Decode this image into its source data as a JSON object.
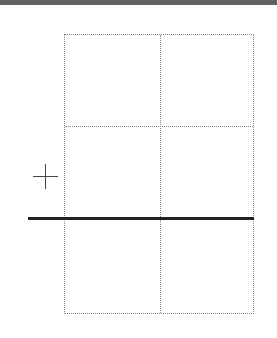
{
  "canvas": {
    "width": 277,
    "height": 338,
    "background": "#ffffff"
  },
  "top_bar": {
    "color": "#555555"
  },
  "grid": {
    "columns": 2,
    "rows": 3,
    "line_color": "#8a8a8a",
    "line_style": "dotted"
  },
  "baseline": {
    "color": "#222222",
    "thickness": 3
  },
  "plus_marker": {
    "icon": "plus-icon",
    "color": "#444444"
  }
}
